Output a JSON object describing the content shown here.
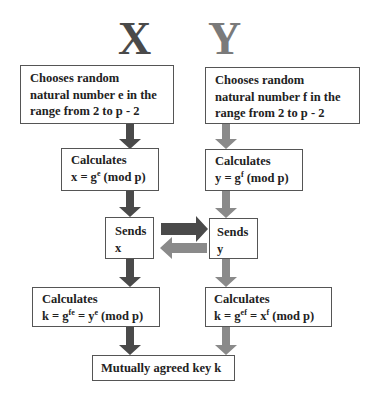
{
  "colors": {
    "party_x": "#4a4a4a",
    "party_y": "#8a8a8a",
    "border": "#555555",
    "text": "#222222"
  },
  "headings": {
    "x": "X",
    "y": "Y"
  },
  "x_column": {
    "choose": {
      "line1": "Chooses random",
      "line2": "natural  number  e in the",
      "line3": "range from  2 to p - 2"
    },
    "calc1": {
      "line1": "Calculates",
      "line2_prefix": "x = g",
      "line2_sup": "e",
      "line2_suffix": " (mod  p)"
    },
    "send": {
      "line1": "Sends",
      "line2": "x"
    },
    "calc2": {
      "line1": "Calculates",
      "line2_a": "k = g",
      "line2_sup1": "fe",
      "line2_b": " = y",
      "line2_sup2": "e",
      "line2_c": "  (mod  p)"
    }
  },
  "y_column": {
    "choose": {
      "line1": "Chooses random",
      "line2": "natural  number  f in the",
      "line3": "range from  2 to p - 2"
    },
    "calc1": {
      "line1": "Calculates",
      "line2_prefix": "y = g",
      "line2_sup": "f",
      "line2_suffix": " (mod  p)"
    },
    "send": {
      "line1": "Sends",
      "line2": "y"
    },
    "calc2": {
      "line1": "Calculates",
      "line2_a": "k = g",
      "line2_sup1": "ef",
      "line2_b": " = x",
      "line2_sup2": "f",
      "line2_c": " (mod  p)"
    }
  },
  "result": {
    "label": "Mutually  agreed key k"
  }
}
